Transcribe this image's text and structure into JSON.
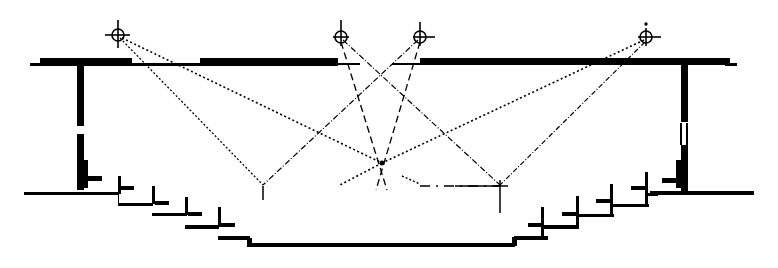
{
  "diagram": {
    "type": "theater-section-lighting",
    "background": "#ffffff",
    "ink": "#000000",
    "lights": [
      {
        "id": "light-1",
        "x": 118,
        "y": 35
      },
      {
        "id": "light-2",
        "x": 341,
        "y": 37
      },
      {
        "id": "light-3",
        "x": 420,
        "y": 37
      },
      {
        "id": "light-4",
        "x": 646,
        "y": 37
      }
    ],
    "targets": [
      {
        "id": "target-left",
        "x": 263,
        "y": 186
      },
      {
        "id": "target-center",
        "x": 382,
        "y": 163
      },
      {
        "id": "target-right",
        "x": 500,
        "y": 186
      }
    ],
    "beams": [
      {
        "from": "light-1",
        "to": "target-left",
        "style": "dotted"
      },
      {
        "from": "light-1",
        "to": "target-center",
        "style": "dotted"
      },
      {
        "from": "light-2",
        "to": "target-right",
        "style": "dashdot"
      },
      {
        "from": "light-2",
        "to": "center-down-left",
        "style": "dashed"
      },
      {
        "from": "light-3",
        "to": "target-left",
        "style": "dashdot"
      },
      {
        "from": "light-3",
        "to": "center-down-right",
        "style": "dashed"
      },
      {
        "from": "light-4",
        "to": "target-right",
        "style": "dashdot"
      },
      {
        "from": "light-4",
        "to": "center-extend",
        "style": "dotted"
      }
    ]
  }
}
